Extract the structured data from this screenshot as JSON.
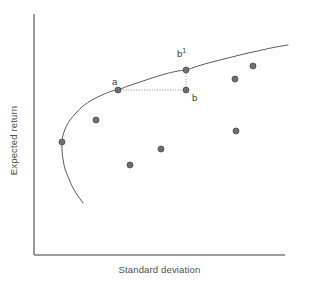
{
  "figure": {
    "width": 310,
    "height": 281,
    "background": "#ffffff"
  },
  "axes": {
    "x_label": "Standard deviation",
    "y_label": "Expected return",
    "axis_color": "#9a9a9a",
    "origin_x": 34,
    "origin_y": 255,
    "x_end": 285,
    "y_top": 14
  },
  "labels": {
    "a": "a",
    "b": "b",
    "b_prime": "b",
    "b_prime_sup": "1"
  },
  "chart_data": {
    "type": "scatter",
    "title": "",
    "subtitle": "",
    "xlabel": "Standard deviation",
    "ylabel": "Expected return",
    "xlim": [
      0,
      1
    ],
    "ylim": [
      0,
      1
    ],
    "grid": false,
    "legend": null,
    "axis_ticks": {
      "x": [],
      "y": []
    },
    "curve": {
      "name": "Efficient frontier",
      "color": "#5a5a65",
      "line_width": 1.0,
      "points_px": [
        [
          83,
          203
        ],
        [
          78,
          196
        ],
        [
          73,
          188
        ],
        [
          69,
          179
        ],
        [
          65,
          169
        ],
        [
          63,
          159
        ],
        [
          62,
          149
        ],
        [
          62,
          142
        ],
        [
          63,
          135
        ],
        [
          66,
          127
        ],
        [
          70,
          120
        ],
        [
          76,
          113
        ],
        [
          83,
          106
        ],
        [
          92,
          100
        ],
        [
          102,
          95
        ],
        [
          112,
          91
        ],
        [
          118,
          90
        ],
        [
          128,
          86
        ],
        [
          140,
          82
        ],
        [
          152,
          78
        ],
        [
          165,
          74
        ],
        [
          178,
          71
        ],
        [
          186,
          70
        ],
        [
          198,
          66
        ],
        [
          212,
          62
        ],
        [
          228,
          58
        ],
        [
          244,
          54
        ],
        [
          262,
          50
        ],
        [
          276,
          47
        ],
        [
          288,
          45
        ]
      ]
    },
    "points": [
      {
        "id": "min-variance",
        "label": "",
        "x_px": 62,
        "y_px": 142,
        "on_frontier": true
      },
      {
        "id": "asset-1",
        "label": "",
        "x_px": 96,
        "y_px": 120,
        "on_frontier": false
      },
      {
        "id": "a",
        "label": "a",
        "x_px": 118,
        "y_px": 90,
        "on_frontier": true
      },
      {
        "id": "asset-2",
        "label": "",
        "x_px": 130,
        "y_px": 165,
        "on_frontier": false
      },
      {
        "id": "b-prime",
        "label": "b1",
        "x_px": 186,
        "y_px": 70,
        "on_frontier": true
      },
      {
        "id": "b",
        "label": "b",
        "x_px": 186,
        "y_px": 90,
        "on_frontier": false
      },
      {
        "id": "asset-3",
        "label": "",
        "x_px": 161,
        "y_px": 149,
        "on_frontier": false
      },
      {
        "id": "asset-4",
        "label": "",
        "x_px": 235,
        "y_px": 79,
        "on_frontier": false
      },
      {
        "id": "asset-5",
        "label": "",
        "x_px": 253,
        "y_px": 66,
        "on_frontier": false
      },
      {
        "id": "asset-6",
        "label": "",
        "x_px": 236,
        "y_px": 131,
        "on_frontier": false
      }
    ],
    "point_style": {
      "fill": "#6e6e78",
      "stroke": "#4a4a52",
      "radius_px": 3.0
    },
    "connectors": [
      {
        "id": "a-to-b",
        "orientation": "horizontal",
        "from_px": [
          118,
          90
        ],
        "to_px": [
          186,
          90
        ],
        "style": "dotted",
        "color": "#8a8a92"
      },
      {
        "id": "b-to-b-prime",
        "orientation": "vertical",
        "from_px": [
          186,
          90
        ],
        "to_px": [
          186,
          70
        ],
        "style": "dotted",
        "color": "#8a8a92"
      }
    ],
    "label_positions": [
      {
        "id": "label-a",
        "text": "a",
        "x_px": 112,
        "y_px": 76
      },
      {
        "id": "label-b",
        "text": "b",
        "x_px": 192,
        "y_px": 92
      },
      {
        "id": "label-b-prime",
        "text": "b1",
        "x_px": 177,
        "y_px": 48
      }
    ]
  }
}
